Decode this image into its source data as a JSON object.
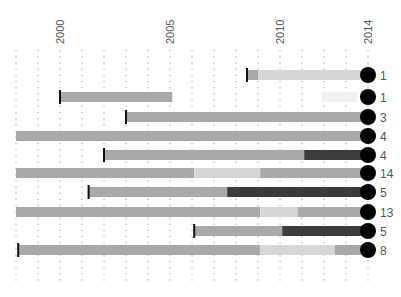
{
  "chart_data": {
    "type": "bar",
    "subtype": "horizontal-timeline-range",
    "title": "",
    "xlabel": "",
    "ylabel": "",
    "x_axis": {
      "ticks_labeled": [
        2000,
        2005,
        2010,
        2014
      ],
      "range": [
        1998,
        2014
      ],
      "gridlines": "dotted, one per year",
      "label_position": "top, rotated"
    },
    "colors": {
      "base": "#a9a9a9",
      "light": "#d6d6d6",
      "faint": "#f0f0f0",
      "dark": "#3c3c3c",
      "start_marker": "#111111",
      "end_dot": "#000000",
      "grid": "#9a9a9a",
      "text": "#555555"
    },
    "rows": [
      {
        "start": 2008.5,
        "has_start_marker": true,
        "count": 1,
        "segments": [
          {
            "from": 2008.5,
            "to": 2009.0,
            "tone": "base"
          },
          {
            "from": 2009.0,
            "to": 2014,
            "tone": "light"
          }
        ]
      },
      {
        "start": 2000,
        "has_start_marker": true,
        "count": 1,
        "segments": [
          {
            "from": 2000,
            "to": 2005.1,
            "tone": "base"
          },
          {
            "from": 2011.9,
            "to": 2013.5,
            "tone": "faint"
          }
        ]
      },
      {
        "start": 2003,
        "has_start_marker": true,
        "count": 3,
        "segments": [
          {
            "from": 2003,
            "to": 2014,
            "tone": "base"
          }
        ]
      },
      {
        "start": 1998,
        "has_start_marker": false,
        "count": 4,
        "segments": [
          {
            "from": 1998,
            "to": 2014,
            "tone": "base"
          }
        ]
      },
      {
        "start": 2002,
        "has_start_marker": true,
        "count": 4,
        "segments": [
          {
            "from": 2002,
            "to": 2011.1,
            "tone": "base"
          },
          {
            "from": 2011.1,
            "to": 2014,
            "tone": "dark"
          }
        ]
      },
      {
        "start": 1998,
        "has_start_marker": false,
        "count": 14,
        "segments": [
          {
            "from": 1998,
            "to": 2006.1,
            "tone": "base"
          },
          {
            "from": 2006.1,
            "to": 2009.1,
            "tone": "light"
          },
          {
            "from": 2009.1,
            "to": 2014,
            "tone": "base"
          }
        ]
      },
      {
        "start": 2001.3,
        "has_start_marker": true,
        "count": 5,
        "segments": [
          {
            "from": 2001.3,
            "to": 2007.6,
            "tone": "base"
          },
          {
            "from": 2007.6,
            "to": 2014,
            "tone": "dark"
          }
        ]
      },
      {
        "start": 1998,
        "has_start_marker": false,
        "count": 13,
        "segments": [
          {
            "from": 1998,
            "to": 2009.1,
            "tone": "base"
          },
          {
            "from": 2009.1,
            "to": 2010.8,
            "tone": "light"
          },
          {
            "from": 2010.8,
            "to": 2014,
            "tone": "base"
          }
        ]
      },
      {
        "start": 2006.1,
        "has_start_marker": true,
        "count": 5,
        "segments": [
          {
            "from": 2006.1,
            "to": 2010.1,
            "tone": "base"
          },
          {
            "from": 2010.1,
            "to": 2014,
            "tone": "dark"
          }
        ]
      },
      {
        "start": 1998.1,
        "has_start_marker": true,
        "count": 8,
        "segments": [
          {
            "from": 1998.1,
            "to": 2009.1,
            "tone": "base"
          },
          {
            "from": 2009.1,
            "to": 2012.5,
            "tone": "light"
          },
          {
            "from": 2012.5,
            "to": 2014,
            "tone": "base"
          }
        ]
      }
    ],
    "counts": [
      1,
      1,
      3,
      4,
      4,
      14,
      5,
      13,
      5,
      8
    ],
    "legend": null
  }
}
